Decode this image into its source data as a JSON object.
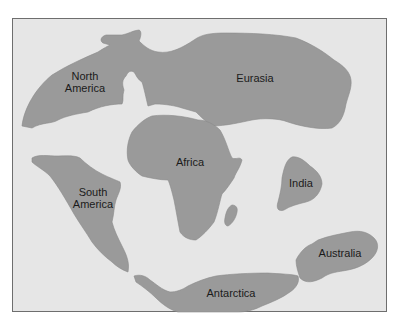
{
  "map": {
    "title": "",
    "background_color": "#e6e6e6",
    "land_color": "#9a9a9a",
    "border_color": "#6e6e6e",
    "labels": {
      "north_america": "North\nAmerica",
      "eurasia": "Eurasia",
      "africa": "Africa",
      "south_america": "South\nAmerica",
      "india": "India",
      "australia": "Australia",
      "antarctica": "Antarctica"
    }
  }
}
